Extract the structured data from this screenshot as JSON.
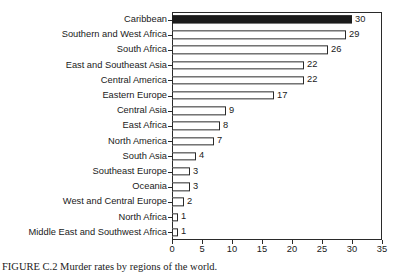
{
  "chart_data": {
    "type": "bar",
    "orientation": "horizontal",
    "title": "",
    "xlabel": "",
    "ylabel": "",
    "xlim": [
      0,
      35
    ],
    "xticks": [
      0,
      5,
      10,
      15,
      20,
      25,
      30,
      35
    ],
    "grid": false,
    "legend": null,
    "categories": [
      "Caribbean",
      "Southern and West Africa",
      "South Africa",
      "East and Southeast Asia",
      "Central America",
      "Eastern Europe",
      "Central Asia",
      "East Africa",
      "North America",
      "South Asia",
      "Southeast Europe",
      "Oceania",
      "West and Central Europe",
      "North Africa",
      "Middle East and Southwest Africa"
    ],
    "values": [
      30,
      29,
      26,
      22,
      22,
      17,
      9,
      8,
      7,
      4,
      3,
      3,
      2,
      1,
      1
    ],
    "value_labels": [
      "30",
      "29",
      "26",
      "22",
      "22",
      "17",
      "9",
      "8",
      "7",
      "4",
      "3",
      "3",
      "2",
      "1",
      "1"
    ],
    "highlighted_index": 0,
    "colors": {
      "bar_fill": "#ffffff",
      "bar_stroke": "#2a2a2a",
      "highlight_fill": "#1c1c1c",
      "axis": "#2a2a2a",
      "text": "#1a1a1a",
      "background": "#ffffff"
    }
  },
  "caption": {
    "text": "FIGURE C.2  Murder rates by regions of the world."
  }
}
